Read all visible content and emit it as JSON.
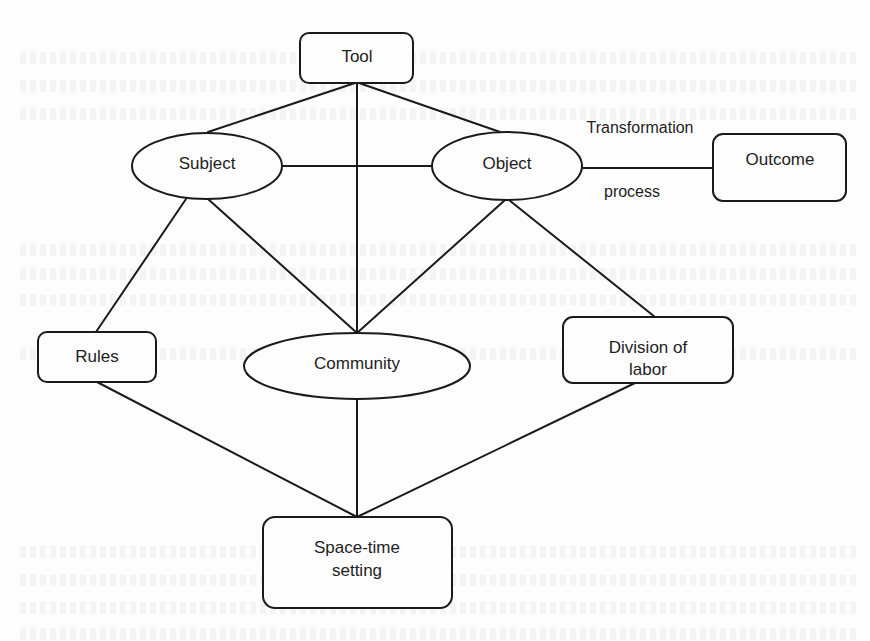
{
  "diagram": {
    "colors": {
      "stroke": "#1a1a1a",
      "text": "#1e1e1e",
      "background": "#fdfdfd"
    },
    "nodes": [
      {
        "id": "tool",
        "label": "Tool",
        "shape": "rounded-rect"
      },
      {
        "id": "subject",
        "label": "Subject",
        "shape": "ellipse"
      },
      {
        "id": "object",
        "label": "Object",
        "shape": "ellipse"
      },
      {
        "id": "outcome",
        "label": "Outcome",
        "shape": "rounded-rect"
      },
      {
        "id": "rules",
        "label": "Rules",
        "shape": "rounded-rect"
      },
      {
        "id": "community",
        "label": "Community",
        "shape": "ellipse"
      },
      {
        "id": "division",
        "label_line1": "Division of",
        "label_line2": "labor",
        "shape": "rounded-rect"
      },
      {
        "id": "spacetime",
        "label_line1": "Space-time",
        "label_line2": "setting",
        "shape": "rounded-rect"
      }
    ],
    "edges": [
      {
        "from": "tool",
        "to": "subject"
      },
      {
        "from": "tool",
        "to": "object"
      },
      {
        "from": "tool",
        "to": "community"
      },
      {
        "from": "subject",
        "to": "object"
      },
      {
        "from": "object",
        "to": "outcome",
        "label_above": "Transformation",
        "label_below": "process"
      },
      {
        "from": "subject",
        "to": "rules"
      },
      {
        "from": "subject",
        "to": "community"
      },
      {
        "from": "object",
        "to": "community"
      },
      {
        "from": "object",
        "to": "division"
      },
      {
        "from": "rules",
        "to": "spacetime"
      },
      {
        "from": "community",
        "to": "spacetime"
      },
      {
        "from": "division",
        "to": "spacetime"
      }
    ]
  }
}
